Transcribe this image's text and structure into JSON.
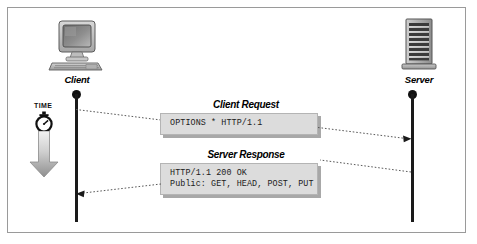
{
  "diagram": {
    "background_color": "#ffffff",
    "frame_border_color": "#9a9a9a",
    "box_fill_color": "#dcdcdc",
    "box_shadow_color": "#a8a8a8",
    "line_color": "#1a1a1a"
  },
  "actors": [
    {
      "id": "client",
      "label": "Client",
      "icon": "desktop-computer-icon"
    },
    {
      "id": "server",
      "label": "Server",
      "icon": "server-tower-icon"
    }
  ],
  "time_axis": {
    "label": "TIME",
    "icon": "stopwatch-icon",
    "arrow_icon": "down-arrow-icon",
    "direction": "downward"
  },
  "messages": [
    {
      "id": "client-request",
      "label": "Client Request",
      "direction": "client-to-server",
      "code_lines": [
        "OPTIONS * HTTP/1.1"
      ]
    },
    {
      "id": "server-response",
      "label": "Server Response",
      "direction": "server-to-client",
      "code_lines": [
        "HTTP/1.1 200 OK",
        "Public: GET, HEAD, POST, PUT"
      ]
    }
  ]
}
